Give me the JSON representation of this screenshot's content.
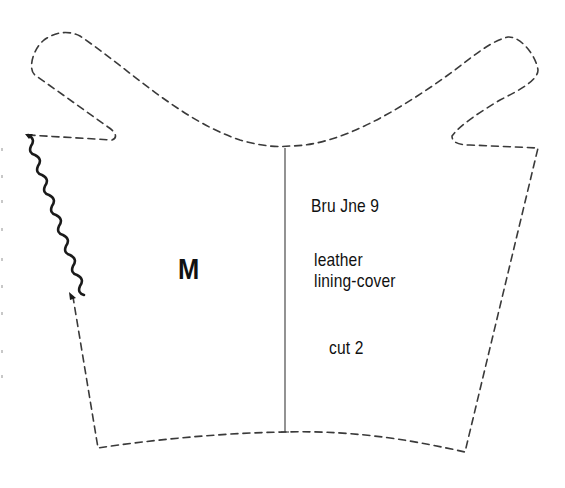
{
  "pattern_piece": {
    "piece_letter": "M",
    "code": "Bru Jne 9",
    "material_line1": "leather",
    "material_line2": "lining-cover",
    "cut_instruction": "cut 2"
  },
  "colors": {
    "line": "#3a3a3a",
    "scallop": "#1a1a1a",
    "text": "#111111",
    "background": "#ffffff"
  }
}
